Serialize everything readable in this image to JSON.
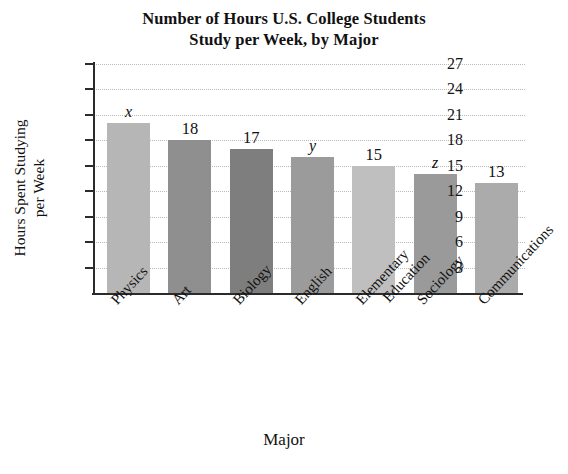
{
  "chart_data": {
    "type": "bar",
    "title": "Number of Hours U.S. College Students Study per Week, by Major",
    "title_lines": [
      "Number of Hours U.S. College Students",
      "Study per Week, by Major"
    ],
    "xlabel": "Major",
    "ylabel": "Hours Spent Studying per Week",
    "ylabel_lines": [
      "Hours Spent Studying",
      "per Week"
    ],
    "categories": [
      "Physics",
      "Art",
      "Biology",
      "English",
      "Elementary Education",
      "Sociology",
      "Communications"
    ],
    "category_lines": [
      [
        "Physics"
      ],
      [
        "Art"
      ],
      [
        "Biology"
      ],
      [
        "English"
      ],
      [
        "Elementary",
        "Education"
      ],
      [
        "Sociology"
      ],
      [
        "Communications"
      ]
    ],
    "values": [
      20,
      18,
      17,
      16,
      15,
      14,
      13
    ],
    "data_labels": [
      "x",
      "18",
      "17",
      "y",
      "15",
      "z",
      "13"
    ],
    "label_is_variable": [
      true,
      false,
      false,
      true,
      false,
      true,
      false
    ],
    "bar_colors": [
      "#b6b6b6",
      "#8f8f8f",
      "#7e7e7e",
      "#9b9b9b",
      "#bfbfbf",
      "#9a9a9a",
      "#ababab"
    ],
    "ylim": [
      0,
      27
    ],
    "yticks": [
      27,
      24,
      21,
      18,
      15,
      12,
      9,
      6,
      3
    ],
    "ytick_labels": [
      "27",
      "24",
      "21",
      "18",
      "15",
      "12",
      "9",
      "6",
      "3"
    ],
    "grid": true,
    "grid_style": "dotted",
    "grid_color": "#b9b9b9",
    "legend": "none",
    "axis_color": "#2b2b2b",
    "background": "#ffffff"
  }
}
